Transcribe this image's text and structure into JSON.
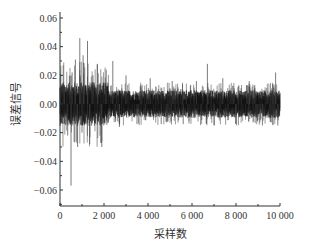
{
  "chart_data": {
    "type": "line",
    "title": "",
    "xlabel": "采样数",
    "ylabel": "误差信号",
    "xlim": [
      0,
      10000
    ],
    "ylim": [
      -0.07,
      0.06
    ],
    "grid": false,
    "legend": null,
    "x_ticks": [
      0,
      2000,
      4000,
      6000,
      8000,
      10000
    ],
    "x_tick_labels": [
      "0",
      "2 000",
      "4 000",
      "6 000",
      "8 000",
      "10 000"
    ],
    "y_ticks": [
      0.06,
      0.04,
      0.02,
      0.0,
      -0.02,
      -0.04,
      -0.06
    ],
    "y_tick_labels": [
      "0.06",
      "0.04",
      "0.02",
      "0.00",
      "−0.02",
      "−0.04",
      "−0.06"
    ],
    "series": [
      {
        "name": "误差信号",
        "color": "#111111",
        "description": "Dense noise signal over 10000 samples; baseline band about ±0.008, large transient spikes early (peak ~0.046 near sample 700-900, trough ~-0.057 near sample 500), later occasional spikes to ~0.02 and ~-0.015",
        "n_samples": 10000,
        "band_amplitude": 0.008,
        "spikes": [
          {
            "x": 200,
            "y": 0.013
          },
          {
            "x": 350,
            "y": -0.022
          },
          {
            "x": 500,
            "y": -0.057
          },
          {
            "x": 550,
            "y": 0.022
          },
          {
            "x": 700,
            "y": 0.031
          },
          {
            "x": 800,
            "y": -0.03
          },
          {
            "x": 900,
            "y": 0.046
          },
          {
            "x": 1000,
            "y": -0.02
          },
          {
            "x": 1050,
            "y": 0.034
          },
          {
            "x": 1250,
            "y": 0.044
          },
          {
            "x": 1350,
            "y": -0.028
          },
          {
            "x": 1500,
            "y": 0.02
          },
          {
            "x": 1700,
            "y": 0.028
          },
          {
            "x": 1900,
            "y": -0.03
          },
          {
            "x": 2100,
            "y": 0.024
          },
          {
            "x": 2400,
            "y": 0.03
          },
          {
            "x": 2700,
            "y": -0.016
          },
          {
            "x": 3000,
            "y": 0.02
          },
          {
            "x": 3500,
            "y": -0.014
          },
          {
            "x": 4100,
            "y": 0.018
          },
          {
            "x": 4600,
            "y": -0.014
          },
          {
            "x": 5100,
            "y": 0.016
          },
          {
            "x": 5600,
            "y": -0.014
          },
          {
            "x": 6200,
            "y": 0.016
          },
          {
            "x": 6700,
            "y": 0.028
          },
          {
            "x": 7000,
            "y": -0.015
          },
          {
            "x": 7400,
            "y": 0.018
          },
          {
            "x": 8000,
            "y": -0.014
          },
          {
            "x": 8600,
            "y": 0.016
          },
          {
            "x": 9200,
            "y": -0.015
          },
          {
            "x": 9800,
            "y": 0.022
          },
          {
            "x": 9900,
            "y": -0.015
          }
        ]
      }
    ]
  }
}
